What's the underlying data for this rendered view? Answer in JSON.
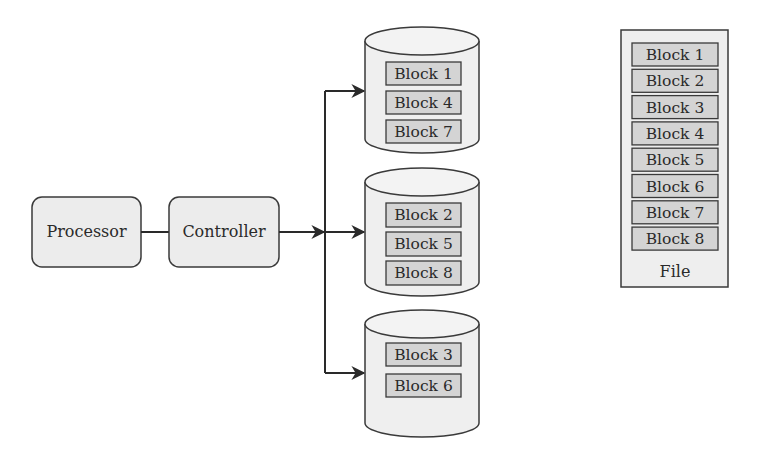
{
  "colors": {
    "stroke": "#3a3a3a",
    "node_fill": "#ececec",
    "disk_fill": "#efefef",
    "block_fill": "#d4d4d4",
    "file_fill": "#eeeeee",
    "text": "#2a2a2a"
  },
  "nodes": {
    "processor": {
      "label": "Processor"
    },
    "controller": {
      "label": "Controller"
    }
  },
  "disks": [
    {
      "name": "disk-1",
      "blocks": [
        "Block 1",
        "Block 4",
        "Block 7"
      ]
    },
    {
      "name": "disk-2",
      "blocks": [
        "Block 2",
        "Block 5",
        "Block 8"
      ]
    },
    {
      "name": "disk-3",
      "blocks": [
        "Block 3",
        "Block 6"
      ]
    }
  ],
  "file": {
    "label": "File",
    "blocks": [
      "Block 1",
      "Block 2",
      "Block 3",
      "Block 4",
      "Block 5",
      "Block 6",
      "Block 7",
      "Block 8"
    ]
  },
  "edges": [
    {
      "from": "processor",
      "to": "controller",
      "type": "line"
    },
    {
      "from": "controller",
      "to": "bus",
      "type": "arrow"
    },
    {
      "from": "bus",
      "to": "disk-1",
      "type": "arrow"
    },
    {
      "from": "bus",
      "to": "disk-2",
      "type": "arrow"
    },
    {
      "from": "bus",
      "to": "disk-3",
      "type": "arrow"
    }
  ]
}
